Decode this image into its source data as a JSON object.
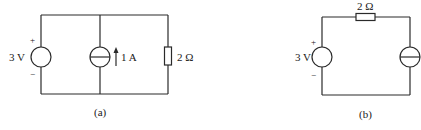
{
  "figures": [
    {
      "id": "a",
      "caption": "(a)",
      "components": {
        "voltage_source": {
          "label": "3 V",
          "plus": "+",
          "minus": "−"
        },
        "current_source": {
          "label": "1 A",
          "direction": "up"
        },
        "resistor": {
          "label": "2 Ω"
        }
      },
      "topology": "parallel"
    },
    {
      "id": "b",
      "caption": "(b)",
      "components": {
        "voltage_source": {
          "label": "3 V",
          "plus": "+",
          "minus": "−"
        },
        "resistor": {
          "label": "2 Ω"
        },
        "current_source": {
          "label": ""
        }
      },
      "topology": "series"
    }
  ],
  "colors": {
    "line": "#2a2a2a",
    "text": "#1a1a1a",
    "background": "#ffffff"
  }
}
